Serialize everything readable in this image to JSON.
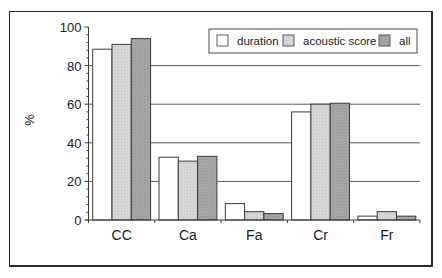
{
  "chart_data": {
    "type": "bar",
    "title": "",
    "xlabel": "",
    "ylabel": "%",
    "ylim": [
      0,
      100
    ],
    "yticks": [
      0,
      20,
      40,
      60,
      80,
      100
    ],
    "grid": "horizontal lines at 20, 40, 60, 80 (drawn behind bars)",
    "legend_position": "top-right inside plot",
    "categories": [
      "CC",
      "Ca",
      "Fa",
      "Cr",
      "Fr"
    ],
    "series": [
      {
        "name": "duration",
        "values": [
          88.5,
          32.5,
          8.5,
          56,
          2
        ],
        "color": "#ffffff"
      },
      {
        "name": "acoustic score",
        "values": [
          91,
          30.5,
          4.3,
          60,
          4.3
        ],
        "color": "#d4d4d4"
      },
      {
        "name": "all",
        "values": [
          94,
          33,
          3.3,
          60.5,
          2
        ],
        "color": "#a9a9a9"
      }
    ]
  },
  "legend": {
    "items": [
      {
        "label": "duration",
        "color": "#ffffff"
      },
      {
        "label": "acoustic score",
        "color": "#d4d4d4"
      },
      {
        "label": "all",
        "color": "#a9a9a9"
      }
    ]
  },
  "axis": {
    "ylabel": "%",
    "ytick_labels": [
      "0",
      "20",
      "40",
      "60",
      "80",
      "100"
    ],
    "xtick_labels": [
      "CC",
      "Ca",
      "Fa",
      "Cr",
      "Fr"
    ]
  }
}
